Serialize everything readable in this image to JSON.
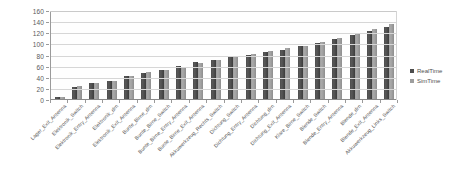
{
  "chart_data": {
    "type": "bar",
    "title": "",
    "subtitle": "",
    "xlabel": "",
    "ylabel": "",
    "ylim": [
      0,
      160
    ],
    "ytick_step": 20,
    "ytick_labels": [
      "0",
      "20",
      "40",
      "60",
      "80",
      "100",
      "120",
      "140",
      "160"
    ],
    "grid": true,
    "grid_axis": "y",
    "legend_position": "right",
    "x_label_rotation": -45,
    "categories": [
      "Lager_Exit_Antenna",
      "Elektronik_Switch",
      "Elektronik_Entry_Antenna",
      "Elektronik_drn",
      "Elektronik_Exit_Antenna",
      "Bunte_Birne_drn",
      "Bunte_Birne_Switch",
      "Bunte_Birne_Entry_Antenna",
      "Bunte_Birne_Exit_Antenna",
      "Akkuwerkzeug_Rechts_Switch",
      "Dichtung_Switch",
      "Dichtung_Entry_Antenna",
      "Dichtung_drn",
      "Dichtung_Exit_Antenna",
      "Klare_Birne_Switch",
      "Blende_Switch",
      "Blende_Entry_Antenna",
      "Blende_drn",
      "Blende_Exit_Antenna",
      "Akkuwerkzeug_Links_Switch"
    ],
    "series": [
      {
        "name": "RealTime",
        "color": "#4d4d4d",
        "values": [
          3,
          22,
          29,
          33,
          41,
          46,
          53,
          59,
          66,
          71,
          75,
          80,
          84,
          89,
          95,
          101,
          108,
          115,
          122,
          130
        ]
      },
      {
        "name": "SimTime",
        "color": "#9e9e9e",
        "values": [
          3,
          24,
          29,
          33,
          41,
          48,
          53,
          57,
          65,
          71,
          77,
          81,
          86,
          91,
          96,
          103,
          110,
          117,
          125,
          134
        ]
      }
    ]
  },
  "legend": {
    "items": [
      {
        "label": "RealTime",
        "color": "#4d4d4d"
      },
      {
        "label": "SimTime",
        "color": "#9e9e9e"
      }
    ]
  }
}
